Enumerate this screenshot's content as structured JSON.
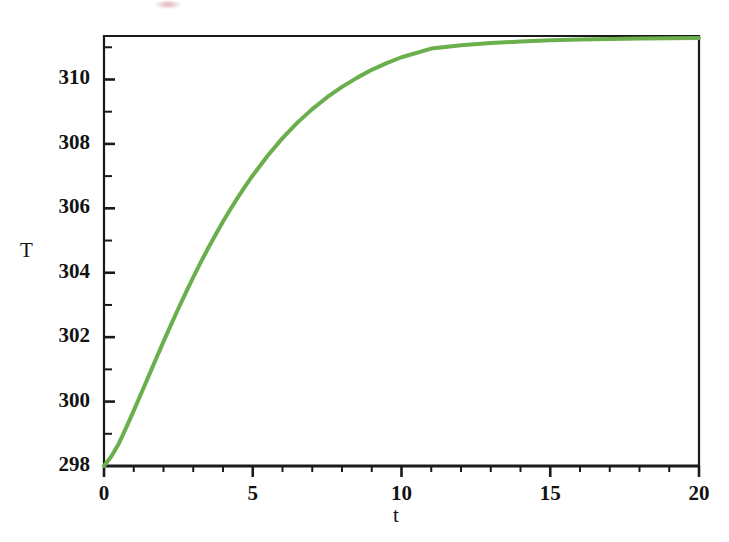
{
  "figure": {
    "background_color": "#ffffff",
    "axis_color": "#1a1a1a",
    "curve_color": "#6aaf4c",
    "x_label": "t",
    "y_label": "T"
  },
  "chart_data": {
    "type": "line",
    "title": "",
    "subtitle": "",
    "xlabel": "t",
    "ylabel": "T",
    "xlim": [
      0,
      20
    ],
    "ylim": [
      298,
      311.35
    ],
    "grid": false,
    "legend": null,
    "annotations": [],
    "x_ticks_major": [
      0,
      5,
      10,
      15,
      20
    ],
    "x_tick_labels": [
      "0",
      "5",
      "10",
      "15",
      "20"
    ],
    "x_ticks_minor_step": 1,
    "y_ticks_major": [
      298,
      300,
      302,
      304,
      306,
      308,
      310
    ],
    "y_tick_labels": [
      "298",
      "300",
      "302",
      "304",
      "306",
      "308",
      "310"
    ],
    "y_ticks_minor": [
      299,
      301,
      303,
      305,
      307,
      309,
      311
    ],
    "series": [
      {
        "name": "T(t)",
        "color": "#6aaf4c",
        "line_width": 4,
        "x": [
          0,
          0.25,
          0.5,
          0.75,
          1,
          1.25,
          1.5,
          1.75,
          2,
          2.25,
          2.5,
          2.75,
          3,
          3.25,
          3.5,
          3.75,
          4,
          4.25,
          4.5,
          4.75,
          5,
          5.5,
          6,
          6.5,
          7,
          7.5,
          8,
          8.5,
          9,
          9.5,
          10,
          11,
          12,
          13,
          14,
          15,
          16,
          17,
          18,
          19,
          20
        ],
        "y": [
          298.0,
          298.3,
          298.7,
          299.2,
          299.72,
          300.25,
          300.79,
          301.33,
          301.86,
          302.38,
          302.89,
          303.38,
          303.86,
          304.32,
          304.76,
          305.18,
          305.59,
          305.97,
          306.34,
          306.69,
          307.02,
          307.63,
          308.18,
          308.66,
          309.08,
          309.45,
          309.77,
          310.05,
          310.3,
          310.51,
          310.69,
          310.96,
          311.06,
          311.13,
          311.18,
          311.22,
          311.24,
          311.26,
          311.27,
          311.28,
          311.29
        ]
      }
    ],
    "asymptote": 311.3,
    "start_value": 298.0
  }
}
